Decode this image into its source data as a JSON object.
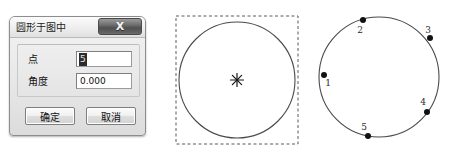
{
  "dialog": {
    "title": "圆形于图中",
    "close_label": "X",
    "close_icon": "close-icon",
    "fields": [
      {
        "label": "点",
        "value": "5",
        "selected": true,
        "placeholder": ""
      },
      {
        "label": "角度",
        "value": "0.000",
        "selected": false,
        "placeholder": ""
      }
    ],
    "buttons": {
      "ok": "确定",
      "cancel": "取消"
    }
  },
  "diagram_bbox": {
    "caption": "",
    "center_marker": "✳",
    "marker_icon": "asterisk-node-icon",
    "circle": {
      "cx": 71,
      "cy": 72,
      "r": 58
    },
    "bbox": {
      "x": 10,
      "y": 8,
      "w": 122,
      "h": 128
    },
    "stroke": "#4a4a4a",
    "dash_stroke": "#5a5a5a"
  },
  "diagram_points": {
    "circle": {
      "cx": 63,
      "cy": 73,
      "r": 60
    },
    "stroke": "#4a4a4a",
    "point_fill": "#111111",
    "points": [
      {
        "id": "1",
        "x": 8,
        "y": 71,
        "lx": 12,
        "ly": 82
      },
      {
        "id": "2",
        "x": 47,
        "y": 16,
        "lx": 44,
        "ly": 29
      },
      {
        "id": "3",
        "x": 114,
        "y": 34,
        "lx": 112,
        "ly": 29
      },
      {
        "id": "4",
        "x": 111,
        "y": 108,
        "lx": 107,
        "ly": 101
      },
      {
        "id": "5",
        "x": 52,
        "y": 132,
        "lx": 48,
        "ly": 126
      }
    ]
  }
}
